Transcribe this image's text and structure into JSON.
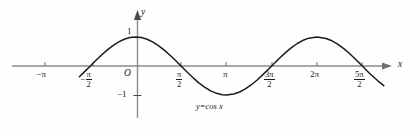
{
  "figure": {
    "name": "cosine-graph",
    "background": "#fefefe",
    "ink": "#1b1b1b",
    "axis_color": "#8a8a8a"
  },
  "axes": {
    "y_axis_label": "y",
    "x_axis_label": "x",
    "origin_label": "O",
    "y_unit_positive": "1",
    "y_unit_negative": "−1"
  },
  "ticks": {
    "x": [
      {
        "label_sign": "−",
        "label_main": "π",
        "frac_num": "",
        "frac_den": "",
        "value": "-pi",
        "x_px": 45
      },
      {
        "label_sign": "−",
        "label_main": "",
        "frac_num": "π",
        "frac_den": "2",
        "value": "-pi/2",
        "x_px": 93
      },
      {
        "label_sign": "",
        "label_main": "",
        "frac_num": "π",
        "frac_den": "2",
        "value": "pi/2",
        "x_px": 181
      },
      {
        "label_sign": "",
        "label_main": "π",
        "frac_num": "",
        "frac_den": "",
        "value": "pi",
        "x_px": 226
      },
      {
        "label_sign": "",
        "label_main": "",
        "frac_num": "3π",
        "frac_den": "2",
        "value": "3pi/2",
        "x_px": 272
      },
      {
        "label_sign": "",
        "label_main": "2π",
        "frac_num": "",
        "frac_den": "",
        "value": "2pi",
        "x_px": 317
      },
      {
        "label_sign": "",
        "label_main": "",
        "frac_num": "5π",
        "frac_den": "2",
        "value": "5pi/2",
        "x_px": 362
      }
    ]
  },
  "curve": {
    "label": "y=cos x",
    "equation": "y = cos x",
    "color": "#1b1b1b"
  },
  "chart_data": {
    "type": "line",
    "title": "",
    "xlabel": "x",
    "ylabel": "y",
    "function": "y = cos x",
    "legend_position": "inline-below-trough",
    "grid": false,
    "xlim": [
      -2.05,
      8.75
    ],
    "ylim": [
      -1.35,
      1.35
    ],
    "x_tick_labels": [
      "−π",
      "−π/2",
      "π/2",
      "π",
      "3π/2",
      "2π",
      "5π/2"
    ],
    "x_tick_values": [
      -3.14159,
      -1.5708,
      1.5708,
      3.14159,
      4.71239,
      6.28319,
      7.85398
    ],
    "y_tick_labels": [
      "1",
      "−1"
    ],
    "y_tick_values": [
      1,
      -1
    ],
    "x": [
      -1.95,
      -1.75,
      -1.5708,
      -1.4,
      -1.2,
      -1.0,
      -0.8,
      -0.6,
      -0.4,
      -0.2,
      0.0,
      0.2,
      0.4,
      0.6,
      0.8,
      1.0,
      1.2,
      1.4,
      1.5708,
      1.8,
      2.0,
      2.2,
      2.4,
      2.6,
      2.8,
      3.0,
      3.14159,
      3.4,
      3.6,
      3.8,
      4.0,
      4.2,
      4.4,
      4.6,
      4.71239,
      5.0,
      5.2,
      5.4,
      5.6,
      5.8,
      6.0,
      6.28319,
      6.6,
      6.8,
      7.0,
      7.2,
      7.4,
      7.6,
      7.85398,
      8.1,
      8.4,
      8.6
    ],
    "y": [
      -0.37,
      -0.178,
      0.0,
      0.17,
      0.362,
      0.54,
      0.697,
      0.825,
      0.921,
      0.98,
      1.0,
      0.98,
      0.921,
      0.825,
      0.697,
      0.54,
      0.362,
      0.17,
      0.0,
      -0.227,
      -0.416,
      -0.589,
      -0.737,
      -0.857,
      -0.942,
      -0.99,
      -1.0,
      -0.967,
      -0.897,
      -0.791,
      -0.654,
      -0.49,
      -0.307,
      -0.112,
      0.0,
      0.284,
      0.469,
      0.635,
      0.776,
      0.886,
      0.96,
      1.0,
      0.95,
      0.869,
      0.754,
      0.608,
      0.438,
      0.251,
      0.0,
      -0.249,
      -0.519,
      -0.677
    ]
  }
}
